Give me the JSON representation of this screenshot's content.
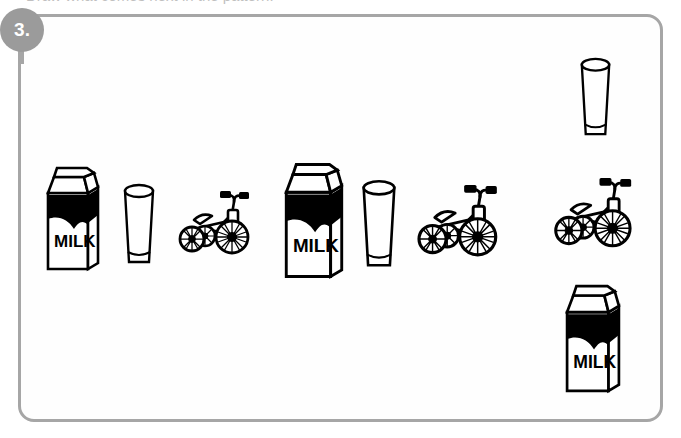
{
  "worksheet": {
    "question_number": "3.",
    "top_cut_text": "Draw what comes next in the pattern.",
    "panel_border_color": "#a6a6a6",
    "badge_color": "#9b9b9b",
    "badge_text_color": "#ffffff",
    "ink_color": "#000000"
  },
  "pattern": {
    "unit_sequence": [
      "milk-carton",
      "drinking-glass",
      "tricycle"
    ],
    "description": "A repeating pattern of milk carton, glass of milk and tricycle that grows in size.",
    "items": [
      {
        "id": "item-1",
        "object": "milk-carton",
        "label": "MILK",
        "group": 1,
        "x": 44,
        "y": 163,
        "width": 58,
        "height": 110,
        "scale": "small"
      },
      {
        "id": "item-2",
        "object": "drinking-glass",
        "label": "",
        "group": 1,
        "x": 117,
        "y": 182,
        "width": 44,
        "height": 88,
        "scale": "small"
      },
      {
        "id": "item-3",
        "object": "tricycle",
        "label": "",
        "group": 1,
        "x": 172,
        "y": 184,
        "width": 86,
        "height": 78,
        "scale": "small"
      },
      {
        "id": "item-4",
        "object": "milk-carton",
        "label": "MILK",
        "group": 2,
        "x": 281,
        "y": 159,
        "width": 66,
        "height": 122,
        "scale": "large"
      },
      {
        "id": "item-5",
        "object": "drinking-glass",
        "label": "",
        "group": 2,
        "x": 355,
        "y": 178,
        "width": 48,
        "height": 96,
        "scale": "large"
      },
      {
        "id": "item-6",
        "object": "tricycle",
        "label": "",
        "group": 2,
        "x": 410,
        "y": 176,
        "width": 97,
        "height": 90,
        "scale": "large"
      },
      {
        "id": "item-7",
        "object": "drinking-glass",
        "label": "",
        "group": 3,
        "x": 574,
        "y": 55,
        "width": 43,
        "height": 88,
        "scale": "large"
      },
      {
        "id": "item-8",
        "object": "tricycle",
        "label": "",
        "group": 3,
        "x": 547,
        "y": 169,
        "width": 94,
        "height": 88,
        "scale": "large"
      },
      {
        "id": "item-9",
        "object": "milk-carton",
        "label": "MILK",
        "group": 3,
        "x": 560,
        "y": 281,
        "width": 66,
        "height": 114,
        "scale": "large"
      }
    ]
  }
}
